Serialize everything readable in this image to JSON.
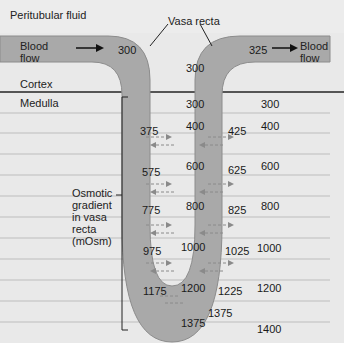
{
  "title_labels": {
    "peritubular_fluid": "Peritubular fluid",
    "blood_flow_in": [
      "Blood",
      "flow"
    ],
    "blood_flow_out": [
      "Blood",
      "flow"
    ],
    "vasa_recta": "Vasa recta",
    "cortex": "Cortex",
    "medulla": "Medulla",
    "osmotic_gradient": [
      "Osmotic",
      "gradient",
      "in vasa",
      "recta",
      "(mOsm)"
    ]
  },
  "values": {
    "inflow": "300",
    "outflow": "325",
    "cortex_interstitium": "300",
    "descending": [
      "375",
      "575",
      "775",
      "975",
      "1175"
    ],
    "ascending": [
      "425",
      "625",
      "825",
      "1025",
      "1225"
    ],
    "inner_interstitium": [
      "300",
      "400",
      "600",
      "800",
      "1000",
      "1200"
    ],
    "outer_interstitium": [
      "300",
      "400",
      "600",
      "800",
      "1000",
      "1200",
      "1400"
    ],
    "bottom_ascending": "1375",
    "bottom_loop": "1375"
  },
  "colors": {
    "background": "#e9e9e9",
    "vessel": "#a9a9a9",
    "vessel_edge": "#8c8c8c",
    "band": "#c8c8c8",
    "divider": "#555555",
    "arrow": "#8a8a8a"
  }
}
